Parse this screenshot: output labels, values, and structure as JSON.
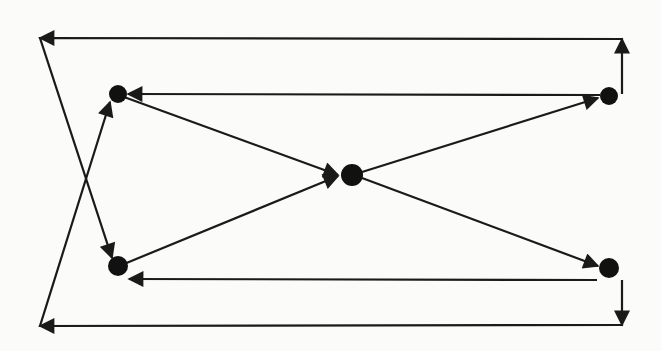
{
  "diagram": {
    "background": "#fbfbfa",
    "stroke_color": "#1a1a1a",
    "node_color": "#111111",
    "ghost_text": "",
    "nodes": [
      {
        "id": "top-left",
        "x": 118,
        "y": 94,
        "r": 9
      },
      {
        "id": "top-right",
        "x": 609,
        "y": 96,
        "r": 9
      },
      {
        "id": "center",
        "x": 352,
        "y": 175,
        "r": 11
      },
      {
        "id": "bottom-left",
        "x": 118,
        "y": 266,
        "r": 10
      },
      {
        "id": "bottom-right",
        "x": 609,
        "y": 268,
        "r": 10
      }
    ],
    "edges": [
      {
        "id": "top-left-to-center",
        "from": "top-left",
        "to": "center",
        "points": [
          [
            124,
            97
          ],
          [
            338,
            175
          ]
        ]
      },
      {
        "id": "bottom-left-to-center",
        "from": "bottom-left",
        "to": "center",
        "points": [
          [
            124,
            264
          ],
          [
            338,
            176
          ]
        ]
      },
      {
        "id": "center-to-top-right",
        "from": "center",
        "to": "top-right",
        "points": [
          [
            362,
            172
          ],
          [
            598,
            98
          ]
        ]
      },
      {
        "id": "center-to-bottom-right",
        "from": "center",
        "to": "bottom-right",
        "points": [
          [
            362,
            178
          ],
          [
            598,
            266
          ]
        ]
      },
      {
        "id": "top-right-to-top-left",
        "from": "top-right",
        "to": "top-left",
        "points": [
          [
            600,
            95
          ],
          [
            128,
            94
          ]
        ]
      },
      {
        "id": "bottom-right-to-bottom-left",
        "from": "bottom-right",
        "to": "bottom-left",
        "points": [
          [
            597,
            280
          ],
          [
            129,
            279
          ]
        ]
      },
      {
        "id": "top-right-loop-to-bottom-left",
        "from": "top-right",
        "to": "bottom-left",
        "points": [
          [
            622,
            94
          ],
          [
            622,
            39
          ],
          [
            40,
            38
          ],
          [
            112,
            258
          ]
        ]
      },
      {
        "id": "bottom-right-loop-to-top-left",
        "from": "bottom-right",
        "to": "top-left",
        "points": [
          [
            622,
            280
          ],
          [
            622,
            325
          ],
          [
            40,
            326
          ],
          [
            110,
            102
          ]
        ]
      }
    ]
  }
}
